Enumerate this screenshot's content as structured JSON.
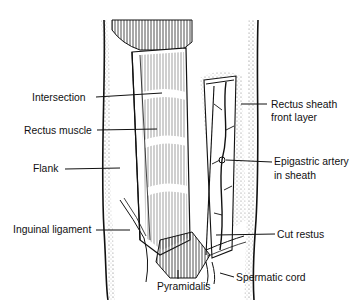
{
  "diagram": {
    "type": "anatomical illustration",
    "labels": {
      "intersection": "Intersection",
      "rectus_muscle": "Rectus muscle",
      "flank": "Flank",
      "inguinal_ligament": "Inguinal ligament",
      "pyramidalis": "Pyramidalis",
      "spermatic_cord": "Spermatic cord",
      "cut_rectus": "Cut restus",
      "epigastric_artery_1": "Epigastric artery",
      "epigastric_artery_2": "in sheath",
      "rectus_sheath_1": "Rectus sheath",
      "rectus_sheath_2": "front layer"
    }
  }
}
